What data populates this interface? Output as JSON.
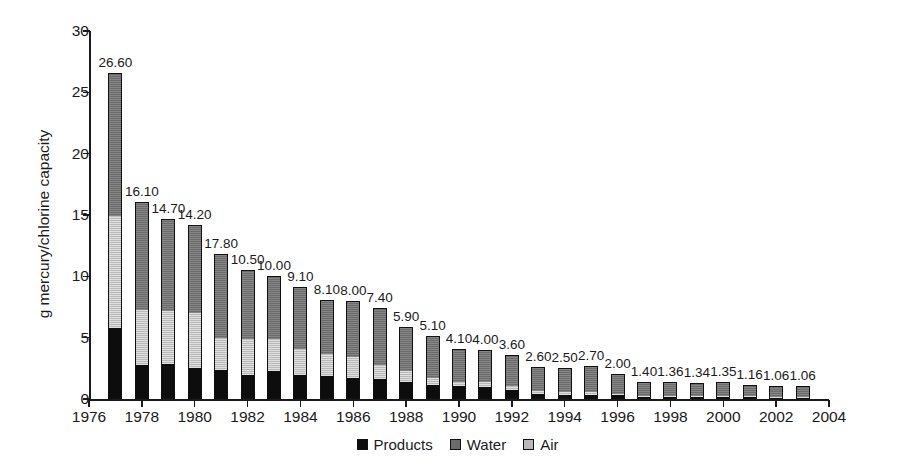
{
  "chart_data": {
    "type": "bar",
    "subtype": "stacked-bar",
    "title": "",
    "xlabel": "",
    "ylabel": "g mercury/chlorine capacity",
    "ylim": [
      0,
      30
    ],
    "yticks": [
      0,
      5,
      10,
      15,
      20,
      25,
      30
    ],
    "xlim": [
      1976,
      2004
    ],
    "xticks": [
      1976,
      1978,
      1980,
      1982,
      1984,
      1986,
      1988,
      1990,
      1992,
      1994,
      1996,
      1998,
      2000,
      2002,
      2004
    ],
    "grid": false,
    "legend_position": "bottom-center",
    "legend": [
      "Products",
      "Water",
      "Air"
    ],
    "colors": {
      "products": "#0d0d0d",
      "water": "#6b6b6b",
      "air": "#b9b9b9",
      "axis": "#1a1a1a",
      "background": "#ffffff"
    },
    "categories": [
      1977,
      1978,
      1979,
      1980,
      1981,
      1982,
      1983,
      1984,
      1985,
      1986,
      1987,
      1988,
      1989,
      1990,
      1991,
      1992,
      1993,
      1994,
      1995,
      1996,
      1997,
      1998,
      1999,
      2000,
      2001,
      2002,
      2003
    ],
    "series": [
      {
        "name": "Products",
        "values": [
          5.75,
          2.8,
          2.85,
          2.55,
          2.35,
          1.95,
          2.25,
          1.95,
          1.85,
          1.75,
          1.6,
          1.4,
          1.15,
          1.05,
          1.0,
          0.75,
          0.4,
          0.35,
          0.35,
          0.3,
          0.2,
          0.2,
          0.2,
          0.18,
          0.16,
          0.15,
          0.15
        ]
      },
      {
        "name": "Air",
        "values": [
          9.15,
          4.45,
          4.35,
          4.45,
          2.6,
          2.95,
          2.65,
          2.15,
          1.85,
          1.7,
          1.15,
          0.9,
          0.55,
          0.3,
          0.35,
          0.3,
          0.25,
          0.2,
          0.2,
          0.1,
          0.05,
          0.05,
          0.05,
          0.05,
          0.05,
          0.05,
          0.05
        ]
      },
      {
        "name": "Water",
        "values": [
          11.7,
          8.85,
          7.5,
          7.2,
          6.85,
          5.6,
          5.1,
          5.0,
          4.4,
          4.55,
          4.65,
          3.6,
          3.4,
          2.75,
          2.65,
          2.55,
          1.95,
          1.95,
          2.15,
          1.6,
          1.15,
          1.11,
          1.09,
          1.12,
          0.95,
          0.86,
          0.86
        ]
      }
    ],
    "bar_totals": [
      26.6,
      16.1,
      14.7,
      14.2,
      11.8,
      10.5,
      10.0,
      9.1,
      8.1,
      8.0,
      7.4,
      5.9,
      5.1,
      4.1,
      4.0,
      3.6,
      2.6,
      2.5,
      2.7,
      2.0,
      1.4,
      1.36,
      1.34,
      1.35,
      1.16,
      1.06,
      1.06
    ],
    "bar_labels": [
      "26.60",
      "16.10",
      "14.70",
      "14.20",
      "17.80",
      "10.50",
      "10.00",
      "9.10",
      "8.10",
      "8.00",
      "7.40",
      "5.90",
      "5.10",
      "4.10",
      "4.00",
      "3.60",
      "2.60",
      "2.50",
      "2.70",
      "2.00",
      "1.40",
      "1.36",
      "1.34",
      "1.35",
      "1.16",
      "1.06",
      "1.06"
    ]
  }
}
